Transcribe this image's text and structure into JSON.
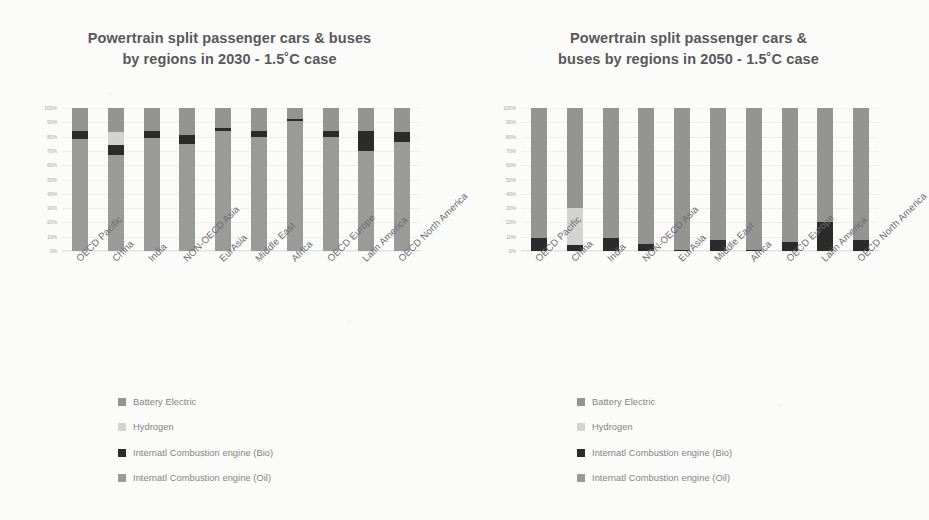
{
  "charts": [
    {
      "id": "chart-2030",
      "title": "Powertrain split passenger cars & buses by regions in 2030 - 1.5˚C case",
      "title_line1": "Powertrain split passenger cars & buses",
      "title_line2": "by regions in 2030 - 1.5˚C case"
    },
    {
      "id": "chart-2050",
      "title": "Powertrain split passenger cars & buses by regions in 2050 - 1.5˚C case",
      "title_line1": "Powertrain split passenger cars &",
      "title_line2": "buses by regions in 2050 - 1.5˚C case"
    }
  ],
  "yticks": [
    "100%",
    "90%",
    "80%",
    "70%",
    "60%",
    "50%",
    "40%",
    "30%",
    "20%",
    "10%",
    "0%"
  ],
  "legend": {
    "items": [
      {
        "label": "Battery Electric",
        "color": "#949493",
        "key": "battery"
      },
      {
        "label": "Hydrogen",
        "color": "#d3d3d1",
        "key": "hydrogen"
      },
      {
        "label": "Internatl Combustion engine (Bio)",
        "color": "#2b2b2b",
        "key": "ice_bio"
      },
      {
        "label": "Internatl Combustion engine (Oil)",
        "color": "#9a9a98",
        "key": "ice_oil"
      }
    ]
  },
  "chart_data": [
    {
      "type": "bar",
      "stacked": true,
      "normalized_percent": true,
      "title": "Powertrain split passenger cars & buses by regions in 2030 - 1.5˚C case",
      "xlabel": "",
      "ylabel": "",
      "ylim": [
        0,
        100
      ],
      "yticks": [
        0,
        10,
        20,
        30,
        40,
        50,
        60,
        70,
        80,
        90,
        100
      ],
      "grid": true,
      "legend_position": "below",
      "categories": [
        "OECD Pacific",
        "China",
        "India",
        "NON-OECD Asia",
        "EurAsia",
        "Middle East",
        "Africa",
        "OECD Europe",
        "Latin America",
        "OECD North America"
      ],
      "series": [
        {
          "name": "Internatl Combustion engine (Oil)",
          "color": "#9a9a98",
          "values": [
            78,
            67,
            79,
            75,
            84,
            80,
            91,
            80,
            70,
            76
          ]
        },
        {
          "name": "Internatl Combustion engine (Bio)",
          "color": "#2b2b2b",
          "values": [
            6,
            7,
            5,
            6,
            2,
            4,
            1,
            4,
            14,
            7
          ]
        },
        {
          "name": "Hydrogen",
          "color": "#d3d3d1",
          "values": [
            0,
            9,
            0,
            0,
            0,
            0,
            0,
            0,
            0,
            0
          ]
        },
        {
          "name": "Battery Electric",
          "color": "#949493",
          "values": [
            16,
            17,
            16,
            19,
            14,
            16,
            8,
            16,
            16,
            17
          ]
        }
      ]
    },
    {
      "type": "bar",
      "stacked": true,
      "normalized_percent": true,
      "title": "Powertrain split passenger cars & buses by regions in 2050 - 1.5˚C case",
      "xlabel": "",
      "ylabel": "",
      "ylim": [
        0,
        100
      ],
      "yticks": [
        0,
        10,
        20,
        30,
        40,
        50,
        60,
        70,
        80,
        90,
        100
      ],
      "grid": true,
      "legend_position": "below",
      "categories": [
        "OECD Pacific",
        "China",
        "India",
        "NON-OECD Asia",
        "EurAsia",
        "Middle East",
        "Africa",
        "OECD Europe",
        "Latin America",
        "OECD North America"
      ],
      "series": [
        {
          "name": "Internatl Combustion engine (Oil)",
          "color": "#9a9a98",
          "values": [
            0,
            0,
            0,
            0,
            0,
            0,
            0,
            0,
            0,
            0
          ]
        },
        {
          "name": "Internatl Combustion engine (Bio)",
          "color": "#2b2b2b",
          "values": [
            9,
            4,
            9,
            5,
            1,
            8,
            1,
            6,
            20,
            8
          ]
        },
        {
          "name": "Hydrogen",
          "color": "#d3d3d1",
          "values": [
            0,
            26,
            0,
            0,
            0,
            0,
            0,
            0,
            0,
            0
          ]
        },
        {
          "name": "Battery Electric",
          "color": "#949493",
          "values": [
            91,
            70,
            91,
            95,
            99,
            92,
            99,
            94,
            80,
            92
          ]
        }
      ]
    }
  ]
}
